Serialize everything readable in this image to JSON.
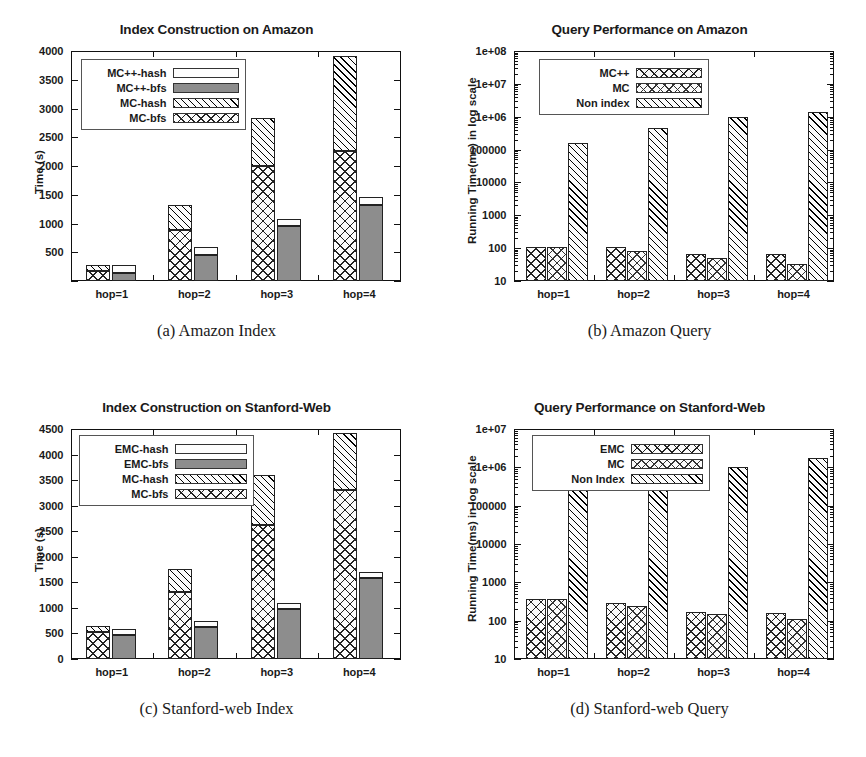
{
  "figure": {
    "panels": [
      {
        "id": "amazon-index",
        "title": "Index Construction on Amazon",
        "caption": "(a) Amazon Index",
        "ylabel": "Time (s)",
        "chart_data": {
          "type": "bar",
          "title": "Index Construction on Amazon",
          "xlabel": "",
          "ylabel": "Time (s)",
          "categories": [
            "hop=1",
            "hop=2",
            "hop=3",
            "hop=4"
          ],
          "ylim": [
            0,
            4000
          ],
          "yticks": [
            0,
            500,
            1000,
            1500,
            2000,
            2500,
            3000,
            3500,
            4000
          ],
          "ytick_labels": [
            "",
            "500",
            "1000",
            "1500",
            "2000",
            "2500",
            "3000",
            "3500",
            "4000"
          ],
          "grid": false,
          "stacked": true,
          "legend_position": "upper-left",
          "bar_groups": [
            {
              "name": "MC",
              "pattern": "crosshatch+diagonal",
              "series": [
                {
                  "name": "MC-bfs",
                  "values": [
                    180,
                    890,
                    2000,
                    2260
                  ]
                },
                {
                  "name": "MC-hash",
                  "values": [
                    100,
                    440,
                    840,
                    1650
                  ]
                }
              ],
              "totals": [
                280,
                1330,
                2840,
                3910
              ]
            },
            {
              "name": "MC++",
              "pattern": "solid+blank",
              "series": [
                {
                  "name": "MC++-bfs",
                  "values": [
                    140,
                    455,
                    955,
                    1330
                  ]
                },
                {
                  "name": "MC++-hash",
                  "values": [
                    140,
                    130,
                    125,
                    135
                  ]
                }
              ],
              "totals": [
                280,
                585,
                1080,
                1465
              ]
            }
          ],
          "legend": [
            {
              "label": "MC++-hash",
              "fill": "blank"
            },
            {
              "label": "MC++-bfs",
              "fill": "solid"
            },
            {
              "label": "MC-hash",
              "fill": "diagonal"
            },
            {
              "label": "MC-bfs",
              "fill": "crosshatch"
            }
          ]
        }
      },
      {
        "id": "amazon-query",
        "title": "Query Performance on Amazon",
        "caption": "(b) Amazon Query",
        "ylabel": "Running Time(ms) in log scale",
        "chart_data": {
          "type": "bar",
          "title": "Query Performance on Amazon",
          "xlabel": "",
          "ylabel": "Running Time(ms) in log scale",
          "categories": [
            "hop=1",
            "hop=2",
            "hop=3",
            "hop=4"
          ],
          "yscale": "log",
          "ylim": [
            10,
            100000000
          ],
          "yticks": [
            10,
            100,
            1000,
            10000,
            100000,
            1000000,
            10000000,
            100000000
          ],
          "ytick_labels": [
            "10",
            "100",
            "1000",
            "10000",
            "100000",
            "1e+06",
            "1e+07",
            "1e+08"
          ],
          "grid": false,
          "legend_position": "upper-center",
          "series": [
            {
              "name": "MC++",
              "fill": "crosshatch",
              "values": [
                110,
                105,
                65,
                68
              ]
            },
            {
              "name": "MC",
              "fill": "crosshatch-dot",
              "values": [
                110,
                82,
                50,
                33
              ]
            },
            {
              "name": "Non index",
              "fill": "diagonal",
              "values": [
                160000,
                460000,
                980000,
                1400000
              ]
            }
          ],
          "legend": [
            {
              "label": "MC++",
              "fill": "crosshatch"
            },
            {
              "label": "MC",
              "fill": "crosshatch-dot"
            },
            {
              "label": "Non index",
              "fill": "diagonal"
            }
          ]
        }
      },
      {
        "id": "stanford-index",
        "title": "Index Construction on Stanford-Web",
        "caption": "(c) Stanford-web Index",
        "ylabel": "Time (s)",
        "chart_data": {
          "type": "bar",
          "title": "Index Construction on Stanford-Web",
          "xlabel": "",
          "ylabel": "Time (s)",
          "categories": [
            "hop=1",
            "hop=2",
            "hop=3",
            "hop=4"
          ],
          "ylim": [
            0,
            4500
          ],
          "yticks": [
            0,
            500,
            1000,
            1500,
            2000,
            2500,
            3000,
            3500,
            4000,
            4500
          ],
          "ytick_labels": [
            "0",
            "500",
            "1000",
            "1500",
            "2000",
            "2500",
            "3000",
            "3500",
            "4000",
            "4500"
          ],
          "grid": false,
          "stacked": true,
          "legend_position": "upper-left",
          "bar_groups": [
            {
              "name": "MC",
              "pattern": "crosshatch+diagonal",
              "series": [
                {
                  "name": "MC-bfs",
                  "values": [
                    520,
                    1320,
                    2620,
                    3300
                  ]
                },
                {
                  "name": "MC-hash",
                  "values": [
                    125,
                    440,
                    975,
                    1120
                  ]
                }
              ],
              "totals": [
                645,
                1760,
                3595,
                4420
              ]
            },
            {
              "name": "EMC",
              "pattern": "solid+blank",
              "series": [
                {
                  "name": "EMC-bfs",
                  "values": [
                    470,
                    625,
                    985,
                    1580
                  ]
                },
                {
                  "name": "EMC-hash",
                  "values": [
                    115,
                    125,
                    110,
                    130
                  ]
                }
              ],
              "totals": [
                585,
                750,
                1095,
                1710
              ]
            }
          ],
          "legend": [
            {
              "label": "EMC-hash",
              "fill": "blank"
            },
            {
              "label": "EMC-bfs",
              "fill": "solid"
            },
            {
              "label": "MC-hash",
              "fill": "diagonal"
            },
            {
              "label": "MC-bfs",
              "fill": "crosshatch"
            }
          ]
        }
      },
      {
        "id": "stanford-query",
        "title": "Query Performance on Stanford-Web",
        "caption": "(d) Stanford-web Query",
        "ylabel": "Running Time(ms) in log scale",
        "chart_data": {
          "type": "bar",
          "title": "Query Performance on Stanford-Web",
          "xlabel": "",
          "ylabel": "Running Time(ms) in log scale",
          "categories": [
            "hop=1",
            "hop=2",
            "hop=3",
            "hop=4"
          ],
          "yscale": "log",
          "ylim": [
            10,
            10000000
          ],
          "yticks": [
            10,
            100,
            1000,
            10000,
            100000,
            1000000,
            10000000
          ],
          "ytick_labels": [
            "10",
            "100",
            "1000",
            "10000",
            "100000",
            "1e+06",
            "1e+07"
          ],
          "grid": false,
          "legend_position": "upper-center",
          "series": [
            {
              "name": "EMC",
              "fill": "crosshatch",
              "values": [
                370,
                290,
                165,
                160
              ]
            },
            {
              "name": "MC",
              "fill": "crosshatch-dot",
              "values": [
                370,
                245,
                148,
                110
              ]
            },
            {
              "name": "Non Index",
              "fill": "diagonal",
              "values": [
                460000,
                530000,
                1000000,
                1700000
              ]
            }
          ],
          "legend": [
            {
              "label": "EMC",
              "fill": "crosshatch"
            },
            {
              "label": "MC",
              "fill": "crosshatch-dot"
            },
            {
              "label": "Non Index",
              "fill": "diagonal"
            }
          ]
        }
      }
    ]
  }
}
